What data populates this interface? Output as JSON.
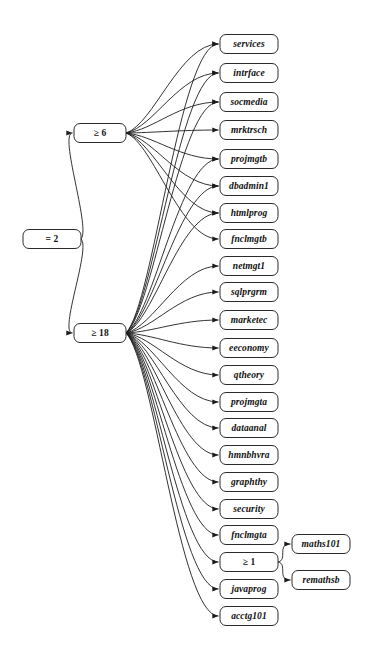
{
  "diagram": {
    "type": "directed-graph",
    "background_color": "#ffffff",
    "node_fill": "#ffffff",
    "node_stroke": "#2b2b2b",
    "edge_color": "#1c1c1c",
    "node_shape": "rounded-rectangle",
    "columns": 3,
    "nodes": [
      {
        "id": "root",
        "label": "= 2",
        "kind": "condition",
        "col": 0,
        "x": 52,
        "y": 239,
        "w": 58,
        "h": 19
      },
      {
        "id": "ge6",
        "label": "≥ 6",
        "kind": "condition",
        "col": 1,
        "x": 100,
        "y": 133,
        "w": 52,
        "h": 19
      },
      {
        "id": "ge18",
        "label": "≥ 18",
        "kind": "condition",
        "col": 1,
        "x": 100,
        "y": 333,
        "w": 52,
        "h": 19
      },
      {
        "id": "services",
        "label": "services",
        "kind": "course",
        "col": 2,
        "x": 249,
        "y": 44,
        "w": 58,
        "h": 19
      },
      {
        "id": "intrface",
        "label": "intrface",
        "kind": "course",
        "col": 2,
        "x": 249,
        "y": 73,
        "w": 58,
        "h": 19
      },
      {
        "id": "socmedia",
        "label": "socmedia",
        "kind": "course",
        "col": 2,
        "x": 249,
        "y": 102,
        "w": 58,
        "h": 19
      },
      {
        "id": "mrktrsch",
        "label": "mrktrsch",
        "kind": "course",
        "col": 2,
        "x": 249,
        "y": 130,
        "w": 58,
        "h": 19
      },
      {
        "id": "projmgtb",
        "label": "projmgtb",
        "kind": "course",
        "col": 2,
        "x": 249,
        "y": 159,
        "w": 58,
        "h": 19
      },
      {
        "id": "dbadmin1",
        "label": "dbadmin1",
        "kind": "course",
        "col": 2,
        "x": 249,
        "y": 186,
        "w": 58,
        "h": 19
      },
      {
        "id": "htmlprog",
        "label": "htmlprog",
        "kind": "course",
        "col": 2,
        "x": 249,
        "y": 213,
        "w": 58,
        "h": 19
      },
      {
        "id": "fnclmgtb",
        "label": "fnclmgtb",
        "kind": "course",
        "col": 2,
        "x": 249,
        "y": 239,
        "w": 58,
        "h": 19
      },
      {
        "id": "netmgt1",
        "label": "netmgt1",
        "kind": "course",
        "col": 2,
        "x": 249,
        "y": 266,
        "w": 58,
        "h": 19
      },
      {
        "id": "sqlprgrm",
        "label": "sqlprgrm",
        "kind": "course",
        "col": 2,
        "x": 249,
        "y": 292,
        "w": 58,
        "h": 19
      },
      {
        "id": "marketec",
        "label": "marketec",
        "kind": "course",
        "col": 2,
        "x": 249,
        "y": 320,
        "w": 58,
        "h": 19
      },
      {
        "id": "eeconomy",
        "label": "eeconomy",
        "kind": "course",
        "col": 2,
        "x": 249,
        "y": 348,
        "w": 58,
        "h": 19
      },
      {
        "id": "qtheory",
        "label": "qtheory",
        "kind": "course",
        "col": 2,
        "x": 249,
        "y": 375,
        "w": 58,
        "h": 19
      },
      {
        "id": "projmgta",
        "label": "projmgta",
        "kind": "course",
        "col": 2,
        "x": 249,
        "y": 402,
        "w": 58,
        "h": 19
      },
      {
        "id": "dataanal",
        "label": "dataanal",
        "kind": "course",
        "col": 2,
        "x": 249,
        "y": 428,
        "w": 58,
        "h": 19
      },
      {
        "id": "hmnbhvra",
        "label": "hmnbhvra",
        "kind": "course",
        "col": 2,
        "x": 249,
        "y": 455,
        "w": 58,
        "h": 19
      },
      {
        "id": "graphthy",
        "label": "graphthy",
        "kind": "course",
        "col": 2,
        "x": 249,
        "y": 482,
        "w": 58,
        "h": 19
      },
      {
        "id": "security",
        "label": "security",
        "kind": "course",
        "col": 2,
        "x": 249,
        "y": 509,
        "w": 58,
        "h": 19
      },
      {
        "id": "fnclmgta",
        "label": "fnclmgta",
        "kind": "course",
        "col": 2,
        "x": 249,
        "y": 535,
        "w": 58,
        "h": 19
      },
      {
        "id": "ge1",
        "label": "≥ 1",
        "kind": "condition",
        "col": 2,
        "x": 249,
        "y": 562,
        "w": 58,
        "h": 19
      },
      {
        "id": "javaprog",
        "label": "javaprog",
        "kind": "course",
        "col": 2,
        "x": 249,
        "y": 589,
        "w": 58,
        "h": 19
      },
      {
        "id": "acctg101",
        "label": "acctg101",
        "kind": "course",
        "col": 2,
        "x": 249,
        "y": 616,
        "w": 58,
        "h": 19
      },
      {
        "id": "maths101",
        "label": "maths101",
        "kind": "course",
        "col": 3,
        "x": 321,
        "y": 544,
        "w": 58,
        "h": 19
      },
      {
        "id": "remathsb",
        "label": "remathsb",
        "kind": "course",
        "col": 3,
        "x": 321,
        "y": 580,
        "w": 58,
        "h": 19
      }
    ],
    "edges": [
      {
        "from": "root",
        "to": "ge6"
      },
      {
        "from": "root",
        "to": "ge18"
      },
      {
        "from": "ge6",
        "to": "services"
      },
      {
        "from": "ge6",
        "to": "intrface"
      },
      {
        "from": "ge6",
        "to": "socmedia"
      },
      {
        "from": "ge6",
        "to": "mrktrsch"
      },
      {
        "from": "ge6",
        "to": "projmgtb"
      },
      {
        "from": "ge6",
        "to": "dbadmin1"
      },
      {
        "from": "ge6",
        "to": "htmlprog"
      },
      {
        "from": "ge6",
        "to": "fnclmgtb"
      },
      {
        "from": "ge18",
        "to": "services"
      },
      {
        "from": "ge18",
        "to": "intrface"
      },
      {
        "from": "ge18",
        "to": "socmedia"
      },
      {
        "from": "ge18",
        "to": "projmgtb"
      },
      {
        "from": "ge18",
        "to": "dbadmin1"
      },
      {
        "from": "ge18",
        "to": "htmlprog"
      },
      {
        "from": "ge18",
        "to": "netmgt1"
      },
      {
        "from": "ge18",
        "to": "sqlprgrm"
      },
      {
        "from": "ge18",
        "to": "marketec"
      },
      {
        "from": "ge18",
        "to": "eeconomy"
      },
      {
        "from": "ge18",
        "to": "qtheory"
      },
      {
        "from": "ge18",
        "to": "projmgta"
      },
      {
        "from": "ge18",
        "to": "dataanal"
      },
      {
        "from": "ge18",
        "to": "hmnbhvra"
      },
      {
        "from": "ge18",
        "to": "graphthy"
      },
      {
        "from": "ge18",
        "to": "security"
      },
      {
        "from": "ge18",
        "to": "fnclmgta"
      },
      {
        "from": "ge18",
        "to": "ge1"
      },
      {
        "from": "ge18",
        "to": "javaprog"
      },
      {
        "from": "ge18",
        "to": "acctg101"
      },
      {
        "from": "ge1",
        "to": "maths101"
      },
      {
        "from": "ge1",
        "to": "remathsb"
      }
    ]
  }
}
